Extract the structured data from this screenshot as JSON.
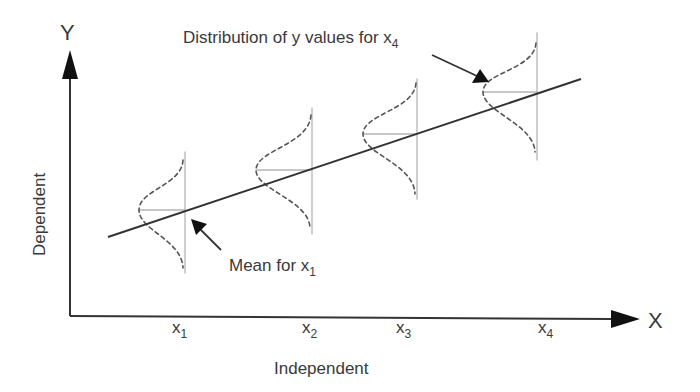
{
  "diagram": {
    "y_axis": {
      "letter": "Y",
      "label": "Dependent"
    },
    "x_axis": {
      "letter": "X",
      "label": "Independent"
    },
    "ticks": [
      {
        "base": "x",
        "sub": "1"
      },
      {
        "base": "x",
        "sub": "2"
      },
      {
        "base": "x",
        "sub": "3"
      },
      {
        "base": "x",
        "sub": "4"
      }
    ],
    "annotations": {
      "distribution": {
        "text": "Distribution of y values for x",
        "sub": "4"
      },
      "mean": {
        "text": "Mean for x",
        "sub": "1"
      }
    },
    "colors": {
      "axis": "#333333",
      "regression_line": "#333333",
      "distribution_curve": "#555555",
      "guide_lines": "#b5b5b5"
    },
    "elements": {
      "regression_line": "solid line, increasing",
      "distributions": 4,
      "curve_style": "dashed normal curves opening left"
    }
  }
}
